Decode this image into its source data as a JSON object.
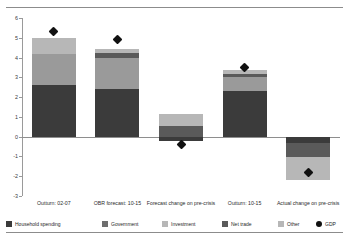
{
  "chart_data": {
    "type": "bar",
    "stacked": true,
    "title": "",
    "subtitle": "",
    "xlabel": "",
    "ylabel": "",
    "ylim": [
      -3,
      6
    ],
    "yticks": [
      6,
      5,
      4,
      3,
      2,
      1,
      0,
      -1,
      -2,
      -3
    ],
    "ytick_labels": [
      "6",
      "5",
      "4",
      "3",
      "2",
      "1",
      "0",
      "-1",
      "-2",
      "-3"
    ],
    "grid": false,
    "legend_position": "bottom",
    "categories": [
      "Outturn: 02-07",
      "OBR forecast: 10-15",
      "Forecast change on pre-crisis",
      "Outturn: 10-15",
      "Actual change on pre-crisis"
    ],
    "series": [
      {
        "name": "Household spending",
        "color": "#3b3b3b",
        "values": [
          2.6,
          2.4,
          -0.2,
          2.3,
          -0.3
        ]
      },
      {
        "name": "Government",
        "color": "#6e6e6e",
        "values": [
          0.0,
          0.0,
          0.0,
          0.0,
          0.0
        ]
      },
      {
        "name": "Investment",
        "color": "#9a9a9a",
        "values": [
          1.6,
          1.6,
          0.0,
          0.7,
          0.0
        ]
      },
      {
        "name": "Net trade",
        "color": "#5a5a5a",
        "values": [
          0.0,
          0.25,
          0.55,
          0.15,
          -0.75
        ]
      },
      {
        "name": "Other",
        "color": "#b7b7b7",
        "values": [
          0.8,
          0.2,
          0.6,
          0.2,
          -1.15
        ]
      }
    ],
    "markers": {
      "name": "GDP",
      "color": "#111111",
      "shape": "diamond",
      "values": [
        5.3,
        4.9,
        -0.4,
        3.5,
        -1.8
      ]
    },
    "legend_entries": [
      {
        "label": "Household spending",
        "color": "#3b3b3b",
        "shape": "square"
      },
      {
        "label": "Government",
        "color": "#6e6e6e",
        "shape": "square"
      },
      {
        "label": "Investment",
        "color": "#b7b7b7",
        "shape": "square"
      },
      {
        "label": "Net trade",
        "color": "#5a5a5a",
        "shape": "square"
      },
      {
        "label": "Other",
        "color": "#b7b7b7",
        "shape": "square"
      },
      {
        "label": "GDP",
        "color": "#111111",
        "shape": "circle"
      }
    ]
  }
}
